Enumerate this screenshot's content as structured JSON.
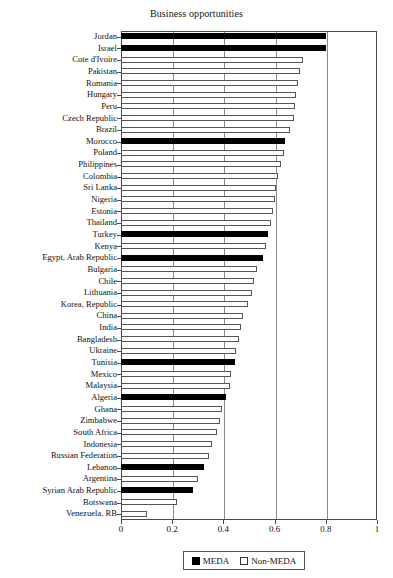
{
  "chart_data": {
    "type": "bar",
    "orientation": "horizontal",
    "title": "Business opportunities",
    "xlabel": "",
    "ylabel": "",
    "xlim": [
      0,
      1
    ],
    "xticks": [
      "0",
      "0.2",
      "0.4",
      "0.6",
      "0.8",
      "1"
    ],
    "xtick_values": [
      0,
      0.2,
      0.4,
      0.6,
      0.8,
      1
    ],
    "grid": "vertical",
    "legend_position": "bottom-center",
    "legend": [
      {
        "label": "MEDA",
        "style": "filled-black"
      },
      {
        "label": "Non-MEDA",
        "style": "hollow-white"
      }
    ],
    "categories": [
      "Jordan",
      "Israel",
      "Cote d'Ivoire",
      "Pakistan",
      "Romania",
      "Hungary",
      "Peru",
      "Czech Republic",
      "Brazil",
      "Morocco",
      "Poland",
      "Philippines",
      "Colombia",
      "Sri Lanka",
      "Nigeria",
      "Estonia",
      "Thailand",
      "Turkey",
      "Kenya",
      "Egypt, Arab Republic",
      "Bulgaria",
      "Chile",
      "Lithuania",
      "Korea, Republic",
      "China",
      "India",
      "Bangladesh",
      "Ukraine",
      "Tunisia",
      "Mexico",
      "Malaysia",
      "Algeria",
      "Ghana",
      "Zimbabwe",
      "South Africa",
      "Indonesia",
      "Russian Federation",
      "Lebanon",
      "Argentina",
      "Syrian Arab Republic",
      "Botswana",
      "Venezuela, RB"
    ],
    "values": [
      0.8,
      0.8,
      0.71,
      0.7,
      0.69,
      0.685,
      0.68,
      0.675,
      0.66,
      0.64,
      0.635,
      0.625,
      0.615,
      0.605,
      0.6,
      0.595,
      0.585,
      0.575,
      0.565,
      0.555,
      0.53,
      0.52,
      0.51,
      0.495,
      0.475,
      0.47,
      0.46,
      0.45,
      0.445,
      0.43,
      0.425,
      0.41,
      0.395,
      0.385,
      0.375,
      0.355,
      0.345,
      0.325,
      0.3,
      0.28,
      0.22,
      0.1
    ],
    "groups": [
      "MEDA",
      "MEDA",
      "Non-MEDA",
      "Non-MEDA",
      "Non-MEDA",
      "Non-MEDA",
      "Non-MEDA",
      "Non-MEDA",
      "Non-MEDA",
      "MEDA",
      "Non-MEDA",
      "Non-MEDA",
      "Non-MEDA",
      "Non-MEDA",
      "Non-MEDA",
      "Non-MEDA",
      "Non-MEDA",
      "MEDA",
      "Non-MEDA",
      "MEDA",
      "Non-MEDA",
      "Non-MEDA",
      "Non-MEDA",
      "Non-MEDA",
      "Non-MEDA",
      "Non-MEDA",
      "Non-MEDA",
      "Non-MEDA",
      "MEDA",
      "Non-MEDA",
      "Non-MEDA",
      "MEDA",
      "Non-MEDA",
      "Non-MEDA",
      "Non-MEDA",
      "Non-MEDA",
      "Non-MEDA",
      "MEDA",
      "Non-MEDA",
      "MEDA",
      "Non-MEDA",
      "Non-MEDA"
    ],
    "colors": {
      "meda": "#000000",
      "nonmeda": "#ffffff",
      "bar_outline": "#555555",
      "gridline": "#8a8a8a",
      "axis": "#4a4a4a",
      "text": "#111111",
      "background": "#ffffff"
    }
  }
}
